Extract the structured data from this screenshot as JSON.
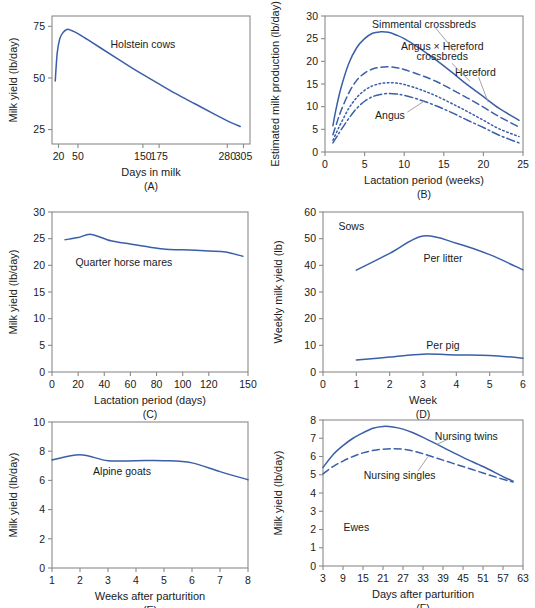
{
  "figure": {
    "title": "",
    "panels": [
      "A",
      "B",
      "C",
      "D",
      "E",
      "F"
    ]
  },
  "chart_data": [
    {
      "id": "A",
      "type": "line",
      "panel_label": "(A)",
      "title": "",
      "xlabel": "Days in milk",
      "ylabel": "Milk yield (lb/day)",
      "xticks": [
        20,
        50,
        150,
        175,
        280,
        305
      ],
      "xticklabels": [
        "20",
        "50",
        "150",
        "175",
        "280",
        "305"
      ],
      "yticks": [
        25,
        50,
        75
      ],
      "yticklabels": [
        "25",
        "50",
        "75"
      ],
      "xlim": [
        10,
        315
      ],
      "ylim": [
        18,
        80
      ],
      "grid": false,
      "legend": "none",
      "annotations": [
        {
          "text": "Holstein cows",
          "x": 150,
          "y": 66
        }
      ],
      "series": [
        {
          "name": "Holstein cows",
          "style": "solid",
          "x": [
            15,
            18,
            22,
            27,
            33,
            40,
            50,
            65,
            85,
            110,
            140,
            170,
            200,
            230,
            260,
            285,
            300
          ],
          "y": [
            48.5,
            62,
            69,
            72,
            73.5,
            73,
            71.5,
            68.5,
            64.5,
            59.5,
            53.5,
            48,
            42.5,
            37.5,
            32.5,
            28.5,
            26.5
          ]
        }
      ]
    },
    {
      "id": "B",
      "type": "line",
      "panel_label": "(B)",
      "title": "",
      "xlabel": "Lactation period (weeks)",
      "ylabel": "Estimated milk production (lb/day)",
      "xticks": [
        0,
        5,
        10,
        15,
        20,
        25
      ],
      "xticklabels": [
        "0",
        "5",
        "10",
        "15",
        "20",
        "25"
      ],
      "yticks": [
        0,
        5,
        10,
        15,
        20,
        25,
        30
      ],
      "yticklabels": [
        "0",
        "5",
        "10",
        "15",
        "20",
        "25",
        "30"
      ],
      "xlim": [
        0,
        25
      ],
      "ylim": [
        0,
        30
      ],
      "grid": false,
      "legend": "inline-annotations",
      "annotations": [
        {
          "text": "Simmental crossbreds",
          "x": 12.5,
          "y": 28.2
        },
        {
          "text": "Angus × Hereford",
          "x": 14.8,
          "y": 23.2
        },
        {
          "text": "crossbreds",
          "x": 14.8,
          "y": 21.0
        },
        {
          "text": "Hereford",
          "x": 19.0,
          "y": 17.6
        },
        {
          "text": "Angus",
          "x": 8.2,
          "y": 8.0
        }
      ],
      "series": [
        {
          "name": "Simmental crossbreds",
          "style": "solid",
          "x": [
            1.0,
            1.4,
            2.0,
            3.0,
            4.0,
            5.0,
            6.0,
            7.0,
            8.0,
            9.0,
            10.0,
            12.0,
            14.0,
            16.0,
            18.0,
            20.0,
            22.0,
            24.5
          ],
          "y": [
            5.8,
            9.5,
            14.0,
            19.5,
            23.0,
            25.0,
            26.2,
            26.5,
            26.4,
            25.8,
            25.0,
            22.8,
            20.3,
            17.6,
            14.8,
            12.2,
            9.6,
            7.0
          ]
        },
        {
          "name": "Angus × Hereford crossbreds",
          "style": "dashed",
          "x": [
            1.0,
            1.5,
            2.0,
            3.0,
            4.0,
            5.0,
            6.0,
            7.0,
            8.0,
            9.0,
            10.0,
            12.0,
            14.0,
            16.0,
            18.0,
            20.0,
            22.0,
            24.5
          ],
          "y": [
            3.8,
            6.5,
            9.0,
            13.0,
            15.8,
            17.4,
            18.3,
            18.7,
            18.8,
            18.6,
            18.2,
            17.0,
            15.6,
            13.8,
            11.9,
            9.9,
            7.8,
            5.5
          ]
        },
        {
          "name": "Hereford",
          "style": "dotted",
          "x": [
            1.0,
            1.5,
            2.0,
            3.0,
            4.0,
            5.0,
            6.0,
            7.0,
            8.0,
            9.0,
            10.0,
            12.0,
            14.0,
            16.0,
            18.0,
            20.0,
            22.0,
            24.5
          ],
          "y": [
            2.6,
            4.5,
            6.3,
            9.6,
            12.0,
            13.6,
            14.6,
            15.1,
            15.3,
            15.2,
            14.9,
            13.8,
            12.4,
            10.7,
            8.9,
            7.0,
            5.1,
            3.4
          ]
        },
        {
          "name": "Angus",
          "style": "dashdot",
          "x": [
            1.0,
            1.5,
            2.0,
            3.0,
            4.0,
            5.0,
            6.0,
            7.0,
            8.0,
            9.0,
            10.0,
            12.0,
            14.0,
            16.0,
            18.0,
            20.0,
            22.0,
            24.5
          ],
          "y": [
            2.0,
            3.4,
            4.8,
            7.4,
            9.6,
            11.2,
            12.2,
            12.7,
            12.9,
            12.8,
            12.5,
            11.5,
            10.2,
            8.7,
            7.0,
            5.4,
            3.7,
            2.0
          ]
        }
      ]
    },
    {
      "id": "C",
      "type": "line",
      "panel_label": "(C)",
      "title": "",
      "xlabel": "Lactation period (days)",
      "ylabel": "Milk yield (lb/day)",
      "xticks": [
        0,
        20,
        40,
        60,
        80,
        100,
        120,
        150
      ],
      "xticklabels": [
        "0",
        "20",
        "40",
        "60",
        "80",
        "100",
        "120",
        "150"
      ],
      "yticks": [
        0,
        5,
        10,
        15,
        20,
        25,
        30
      ],
      "yticklabels": [
        "0",
        "5",
        "10",
        "15",
        "20",
        "25",
        "30"
      ],
      "xlim": [
        0,
        150
      ],
      "ylim": [
        0,
        30
      ],
      "grid": false,
      "legend": "none",
      "annotations": [
        {
          "text": "Quarter horse mares",
          "x": 55,
          "y": 20.6
        }
      ],
      "series": [
        {
          "name": "Quarter horse mares",
          "style": "solid",
          "x": [
            10,
            20,
            30,
            45,
            60,
            75,
            87,
            100,
            120,
            133,
            146
          ],
          "y": [
            24.8,
            25.2,
            25.8,
            24.6,
            24.0,
            23.4,
            23.0,
            22.9,
            22.7,
            22.5,
            21.7
          ]
        }
      ]
    },
    {
      "id": "D",
      "type": "line",
      "panel_label": "(D)",
      "title": "",
      "xlabel": "Week",
      "ylabel": "Weekly milk yield (lb)",
      "xticks": [
        0,
        1,
        2,
        3,
        4,
        5,
        6
      ],
      "xticklabels": [
        "0",
        "1",
        "2",
        "3",
        "4",
        "5",
        "6"
      ],
      "yticks": [
        0,
        10,
        20,
        30,
        40,
        50,
        60
      ],
      "yticklabels": [
        "0",
        "10",
        "20",
        "30",
        "40",
        "50",
        "60"
      ],
      "xlim": [
        0,
        6
      ],
      "ylim": [
        0,
        60
      ],
      "grid": false,
      "legend": "inline-annotations",
      "annotations": [
        {
          "text": "Sows",
          "x": 0.85,
          "y": 54.5
        },
        {
          "text": "Per litter",
          "x": 3.6,
          "y": 42.5
        },
        {
          "text": "Per pig",
          "x": 3.6,
          "y": 10.0
        }
      ],
      "series": [
        {
          "name": "Per litter",
          "style": "solid",
          "x": [
            1,
            2,
            3,
            4,
            5,
            6
          ],
          "y": [
            38.2,
            44.5,
            51.0,
            48.3,
            44.0,
            38.3
          ]
        },
        {
          "name": "Per pig",
          "style": "solid",
          "x": [
            1,
            2,
            3,
            4,
            5,
            6
          ],
          "y": [
            4.5,
            5.6,
            6.7,
            6.4,
            6.2,
            5.2
          ]
        }
      ]
    },
    {
      "id": "E",
      "type": "line",
      "panel_label": "(E)",
      "title": "",
      "xlabel": "Weeks after parturition",
      "ylabel": "Milk yield (lb/day)",
      "xticks": [
        1,
        2,
        3,
        4,
        5,
        6,
        7,
        8
      ],
      "xticklabels": [
        "1",
        "2",
        "3",
        "4",
        "5",
        "6",
        "7",
        "8"
      ],
      "yticks": [
        0,
        2,
        4,
        6,
        8,
        10
      ],
      "yticklabels": [
        "0",
        "2",
        "4",
        "6",
        "8",
        "10"
      ],
      "xlim": [
        1,
        8
      ],
      "ylim": [
        0,
        10
      ],
      "grid": false,
      "legend": "none",
      "annotations": [
        {
          "text": "Alpine goats",
          "x": 3.5,
          "y": 6.6
        }
      ],
      "series": [
        {
          "name": "Alpine goats",
          "style": "solid",
          "x": [
            1,
            2,
            3,
            4,
            5,
            6,
            7,
            8
          ],
          "y": [
            7.4,
            7.75,
            7.35,
            7.35,
            7.35,
            7.2,
            6.6,
            6.05
          ]
        }
      ]
    },
    {
      "id": "F",
      "type": "line",
      "panel_label": "(F)",
      "title": "",
      "xlabel": "Days after parturition",
      "ylabel": "Milk yield (lb/day)",
      "xticks": [
        3,
        9,
        15,
        21,
        27,
        33,
        39,
        45,
        51,
        57,
        63
      ],
      "xticklabels": [
        "3",
        "9",
        "15",
        "21",
        "27",
        "33",
        "39",
        "45",
        "51",
        "57",
        "63"
      ],
      "yticks": [
        0,
        1,
        2,
        3,
        4,
        5,
        6,
        7,
        8
      ],
      "yticklabels": [
        "0",
        "1",
        "2",
        "3",
        "4",
        "5",
        "6",
        "7",
        "8"
      ],
      "xlim": [
        3,
        63
      ],
      "ylim": [
        0,
        8
      ],
      "grid": false,
      "legend": "inline-annotations",
      "annotations": [
        {
          "text": "Nursing twins",
          "x": 46,
          "y": 7.1
        },
        {
          "text": "Nursing singles",
          "x": 26,
          "y": 4.95
        },
        {
          "text": "Ewes",
          "x": 13,
          "y": 2.1
        }
      ],
      "series": [
        {
          "name": "Nursing twins",
          "style": "solid",
          "x": [
            3,
            6,
            9,
            12,
            15,
            18,
            21,
            24,
            27,
            30,
            33,
            39,
            45,
            51,
            57,
            60
          ],
          "y": [
            5.4,
            6.1,
            6.6,
            7.0,
            7.3,
            7.55,
            7.65,
            7.62,
            7.5,
            7.3,
            7.05,
            6.5,
            5.95,
            5.45,
            4.9,
            4.65
          ]
        },
        {
          "name": "Nursing singles",
          "style": "dashed",
          "x": [
            3,
            6,
            9,
            12,
            15,
            18,
            21,
            24,
            27,
            30,
            33,
            39,
            45,
            51,
            57,
            60
          ],
          "y": [
            5.05,
            5.45,
            5.75,
            6.0,
            6.2,
            6.33,
            6.4,
            6.42,
            6.4,
            6.3,
            6.15,
            5.8,
            5.45,
            5.1,
            4.75,
            4.6
          ]
        }
      ]
    }
  ],
  "colors": {
    "curve": "#3a5fa8",
    "axis": "#8a8a8a",
    "text": "#1a1a1a",
    "leader": "#9a9a9a"
  }
}
